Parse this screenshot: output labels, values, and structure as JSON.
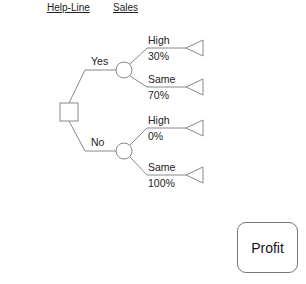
{
  "header": {
    "columns": [
      {
        "label": "Help-Line"
      },
      {
        "label": "Sales"
      }
    ]
  },
  "tree": {
    "decision": {
      "branches": [
        {
          "label": "Yes",
          "chance_outcomes": [
            {
              "label": "High",
              "probability": "30%"
            },
            {
              "label": "Same",
              "probability": "70%"
            }
          ]
        },
        {
          "label": "No",
          "chance_outcomes": [
            {
              "label": "High",
              "probability": "0%"
            },
            {
              "label": "Same",
              "probability": "100%"
            }
          ]
        }
      ]
    }
  },
  "profit_button": {
    "label": "Profit"
  },
  "colors": {
    "line": "#888888",
    "text": "#222222",
    "background": "#ffffff"
  }
}
